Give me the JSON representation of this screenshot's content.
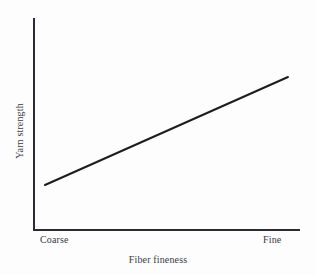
{
  "chart_data": {
    "type": "line",
    "title": "",
    "subtitle": "",
    "xlabel": "Fiber fineness",
    "ylabel": "Yarn strength",
    "x_tick_labels": [
      "Coarse",
      "Fine"
    ],
    "y_tick_labels": [],
    "grid": false,
    "legend": null,
    "annotations": [],
    "axis_color": "#2b2b33",
    "line_color": "#1c1c22",
    "text_color": "#3a3a44",
    "background_color": "#fdfdfd",
    "xlim": [
      0,
      1
    ],
    "ylim": [
      0,
      1
    ],
    "series": [
      {
        "name": "Yarn strength vs fiber fineness",
        "x": [
          0.04,
          1.0
        ],
        "values": [
          0.212,
          0.722
        ],
        "relationship": "linear increasing"
      }
    ],
    "geometry": {
      "y_axis_x": 34,
      "y_axis_top": 18,
      "x_axis_y": 230,
      "x_axis_right": 300,
      "line_start": [
        45,
        185
      ],
      "line_end": [
        288,
        77
      ],
      "axis_width": 2,
      "line_width": 2
    }
  },
  "figure": {
    "x_axis_title": "Fiber fineness",
    "y_axis_title": "Yarn strength",
    "tick_coarse": "Coarse",
    "tick_fine": "Fine"
  }
}
